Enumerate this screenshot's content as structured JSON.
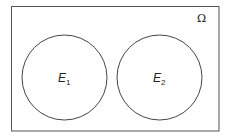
{
  "diagram": {
    "type": "venn",
    "universe": {
      "label": "Ω"
    },
    "sets": [
      {
        "name": "E",
        "subscript": "1"
      },
      {
        "name": "E",
        "subscript": "2"
      }
    ],
    "relationship": "disjoint",
    "colors": {
      "stroke": "#444444",
      "background": "#ffffff"
    }
  }
}
